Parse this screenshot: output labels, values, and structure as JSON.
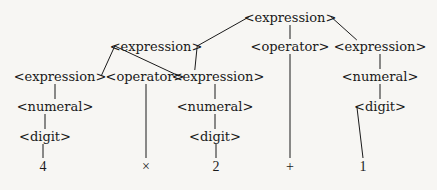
{
  "diagram": {
    "type": "parse-tree",
    "nodes": [
      {
        "id": "n0",
        "label": "<expression>",
        "kind": "nonterminal",
        "parent": null
      },
      {
        "id": "n1",
        "label": "<expression>",
        "kind": "nonterminal",
        "parent": "n0"
      },
      {
        "id": "n2",
        "label": "<operator>",
        "kind": "nonterminal",
        "parent": "n0"
      },
      {
        "id": "n3",
        "label": "<expression>",
        "kind": "nonterminal",
        "parent": "n0"
      },
      {
        "id": "n4",
        "label": "<expression>",
        "kind": "nonterminal",
        "parent": "n1"
      },
      {
        "id": "n5",
        "label": "<operator>",
        "kind": "nonterminal",
        "parent": "n1"
      },
      {
        "id": "n6",
        "label": "<expression>",
        "kind": "nonterminal",
        "parent": "n1"
      },
      {
        "id": "n7",
        "label": "<numeral>",
        "kind": "nonterminal",
        "parent": "n3"
      },
      {
        "id": "n8",
        "label": "<numeral>",
        "kind": "nonterminal",
        "parent": "n4"
      },
      {
        "id": "n9",
        "label": "<numeral>",
        "kind": "nonterminal",
        "parent": "n6"
      },
      {
        "id": "n10",
        "label": "<digit>",
        "kind": "nonterminal",
        "parent": "n7"
      },
      {
        "id": "n11",
        "label": "<digit>",
        "kind": "nonterminal",
        "parent": "n8"
      },
      {
        "id": "n12",
        "label": "<digit>",
        "kind": "nonterminal",
        "parent": "n9"
      },
      {
        "id": "t0",
        "label": "4",
        "kind": "terminal",
        "parent": "n11"
      },
      {
        "id": "t1",
        "label": "×",
        "kind": "terminal",
        "parent": "n5"
      },
      {
        "id": "t2",
        "label": "2",
        "kind": "terminal",
        "parent": "n12"
      },
      {
        "id": "t3",
        "label": "+",
        "kind": "terminal",
        "parent": "n2"
      },
      {
        "id": "t4",
        "label": "1",
        "kind": "terminal",
        "parent": "n10"
      }
    ],
    "expression": "4 × 2 + 1"
  }
}
